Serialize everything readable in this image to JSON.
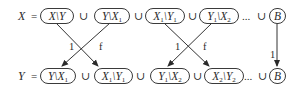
{
  "top_row": {
    "lhs": "X",
    "eq": "=",
    "sets": [
      {
        "a": "X",
        "a_sub": "",
        "b": "Y",
        "b_sub": ""
      },
      {
        "a": "Y",
        "a_sub": "",
        "b": "X",
        "b_sub": "1"
      },
      {
        "a": "X",
        "a_sub": "1",
        "b": "Y",
        "b_sub": "1"
      },
      {
        "a": "Y",
        "a_sub": "1",
        "b": "X",
        "b_sub": "2"
      },
      {
        "a": "B"
      }
    ],
    "union": "∪",
    "ellipsis": "..."
  },
  "bottom_row": {
    "lhs": "Y",
    "eq": "=",
    "sets": [
      {
        "a": "Y",
        "a_sub": "",
        "b": "X",
        "b_sub": "1"
      },
      {
        "a": "X",
        "a_sub": "1",
        "b": "Y",
        "b_sub": "1"
      },
      {
        "a": "Y",
        "a_sub": "1",
        "b": "X",
        "b_sub": "2"
      },
      {
        "a": "X",
        "a_sub": "2",
        "b": "Y",
        "b_sub": "2"
      },
      {
        "a": "B"
      }
    ],
    "union": "∪",
    "ellipsis": "..."
  },
  "arrows": {
    "pair1": {
      "left_label": "1",
      "right_label": "f"
    },
    "pair2": {
      "left_label": "1",
      "right_label": "f"
    },
    "b_label": "1"
  },
  "setminus": "\\"
}
